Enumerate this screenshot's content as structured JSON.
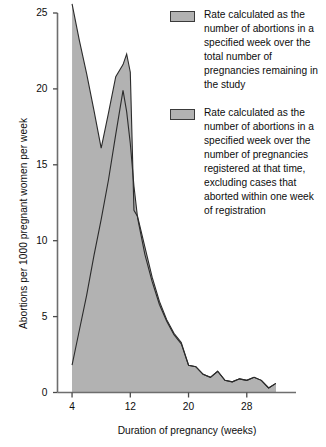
{
  "chart_data": {
    "type": "area",
    "title": "",
    "subtitle": "",
    "xlabel": "Duration of pregnancy (weeks)",
    "ylabel": "Abortions per 1000 pregnant women per week",
    "xlim": [
      2,
      33
    ],
    "ylim": [
      0,
      25
    ],
    "xticks": [
      4,
      12,
      20,
      28
    ],
    "yticks": [
      0,
      5,
      10,
      15,
      20,
      25
    ],
    "xtick_labels": [
      "4",
      "12",
      "20",
      "28"
    ],
    "ytick_labels": [
      "0",
      "5",
      "10",
      "15",
      "20",
      "25"
    ],
    "grid": false,
    "legend_position": "top-right",
    "series": [
      {
        "name": "Rate calculated as the number of abortions in a specified week over the total number of pregnancies remaining in the study",
        "fill_color": "#b2b2b2",
        "line_color": "#2b2b2b",
        "x": [
          4,
          5,
          6,
          7,
          8,
          9,
          10,
          11,
          11.5,
          12,
          12.5,
          13,
          14,
          15,
          16,
          17,
          18,
          19,
          20,
          21,
          22,
          23,
          24,
          25,
          26,
          27,
          28,
          29,
          30,
          31,
          32
        ],
        "values": [
          25.6,
          23.2,
          21.0,
          18.6,
          16.1,
          18.4,
          20.8,
          21.6,
          22.3,
          21.1,
          12.0,
          11.6,
          9.6,
          7.6,
          6.0,
          4.8,
          3.9,
          3.3,
          1.8,
          1.7,
          1.2,
          1.0,
          1.4,
          0.8,
          0.7,
          0.9,
          0.8,
          1.0,
          0.8,
          0.3,
          0.6
        ]
      },
      {
        "name": "Rate calculated as the number of abortions in a specified week over the number of pregnancies registered at that time, excluding cases that aborted within one week of registration",
        "fill_color": "#b2b2b2",
        "line_color": "#2b2b2b",
        "x": [
          4,
          5,
          6,
          7,
          8,
          9,
          10,
          11,
          11.5,
          12,
          12.5,
          13,
          14,
          15,
          16,
          17,
          18,
          19,
          20,
          21,
          22,
          23,
          24,
          25,
          26,
          27,
          28,
          29,
          30,
          31,
          32
        ],
        "values": [
          1.8,
          4.1,
          6.4,
          9.0,
          11.4,
          14.0,
          17.0,
          19.9,
          18.5,
          16.4,
          13.6,
          11.5,
          9.1,
          7.3,
          5.8,
          4.7,
          3.8,
          3.2,
          1.8,
          1.7,
          1.2,
          1.0,
          1.4,
          0.8,
          0.7,
          0.9,
          0.8,
          1.0,
          0.8,
          0.3,
          0.6
        ]
      }
    ]
  },
  "legend": {
    "entries": [
      {
        "label": "Rate calculated as the number of abortions in a specified week over the total number of pregnancies remaining in the study",
        "color": "#b2b2b2"
      },
      {
        "label": "Rate calculated as the number of abortions in a specified week over the number of pregnancies registered at that time, excluding cases that aborted within one week of registration",
        "color": "#b2b2b2"
      }
    ]
  },
  "axes": {
    "y_axis_title": "Abortions per 1000 pregnant women per week",
    "x_axis_title": "Duration of pregnancy (weeks)",
    "axis_color": "#6e6e6e"
  }
}
